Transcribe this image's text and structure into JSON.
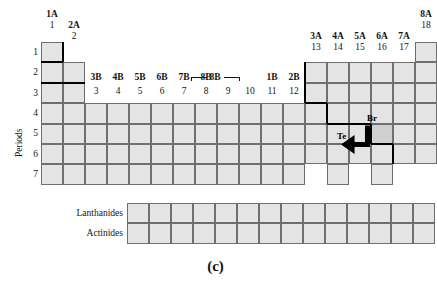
{
  "figure": {
    "caption": "(c)",
    "axis_label_periods": "Periods"
  },
  "groups": {
    "main_a": [
      {
        "roman": "1A",
        "number": "1"
      },
      {
        "roman": "2A",
        "number": "2"
      },
      {
        "roman": "3A",
        "number": "13"
      },
      {
        "roman": "4A",
        "number": "14"
      },
      {
        "roman": "5A",
        "number": "15"
      },
      {
        "roman": "6A",
        "number": "16"
      },
      {
        "roman": "7A",
        "number": "17"
      },
      {
        "roman": "8A",
        "number": "18"
      }
    ],
    "transition_b": [
      {
        "roman": "3B",
        "number": "3"
      },
      {
        "roman": "4B",
        "number": "4"
      },
      {
        "roman": "5B",
        "number": "5"
      },
      {
        "roman": "6B",
        "number": "6"
      },
      {
        "roman": "7B",
        "number": "7"
      },
      {
        "roman": "8B",
        "number": "8"
      },
      {
        "roman": "",
        "number": "9"
      },
      {
        "roman": "",
        "number": "10"
      },
      {
        "roman": "1B",
        "number": "11"
      },
      {
        "roman": "2B",
        "number": "12"
      }
    ],
    "eight_b_label": "8B"
  },
  "periods": [
    "1",
    "2",
    "3",
    "4",
    "5",
    "6",
    "7"
  ],
  "series_rows": [
    {
      "label": "Lanthanides",
      "cell_count": 14
    },
    {
      "label": "Actinides",
      "cell_count": 14
    }
  ],
  "annotations": [
    {
      "symbol": "Br",
      "name": "bromine-label"
    },
    {
      "symbol": "Te",
      "name": "tellurium-label"
    }
  ],
  "colors": {
    "cell_fill": "#e4e4e4",
    "cell_border": "#6f6f6f",
    "stair_line": "#000000",
    "text": "#141414",
    "background": "#ffffff"
  },
  "chart_data": {
    "type": "table",
    "grid_columns": 18,
    "grid_rows": 7,
    "filled_cells_per_period": [
      {
        "period": "1",
        "groups": [
          1,
          18
        ]
      },
      {
        "period": "2",
        "groups": [
          1,
          2,
          13,
          14,
          15,
          16,
          17,
          18
        ]
      },
      {
        "period": "3",
        "groups": [
          1,
          2,
          13,
          14,
          15,
          16,
          17,
          18
        ]
      },
      {
        "period": "4",
        "groups": [
          1,
          2,
          3,
          4,
          5,
          6,
          7,
          8,
          9,
          10,
          11,
          12,
          13,
          14,
          15,
          16,
          17,
          18
        ]
      },
      {
        "period": "5",
        "groups": [
          1,
          2,
          3,
          4,
          5,
          6,
          7,
          8,
          9,
          10,
          11,
          12,
          13,
          14,
          15,
          16,
          17,
          18
        ]
      },
      {
        "period": "6",
        "groups": [
          1,
          2,
          3,
          4,
          5,
          6,
          7,
          8,
          9,
          10,
          11,
          12,
          13,
          14,
          15,
          16,
          17,
          18
        ]
      },
      {
        "period": "7",
        "groups": [
          1,
          2,
          3,
          4,
          5,
          6,
          7,
          8,
          9,
          10,
          11,
          12,
          14,
          16
        ]
      }
    ],
    "metalloid_staircase": "bold line stepping from group 13 row 2 down and right to group 17 row 6",
    "highlighted_elements": [
      "Br",
      "Te"
    ]
  }
}
